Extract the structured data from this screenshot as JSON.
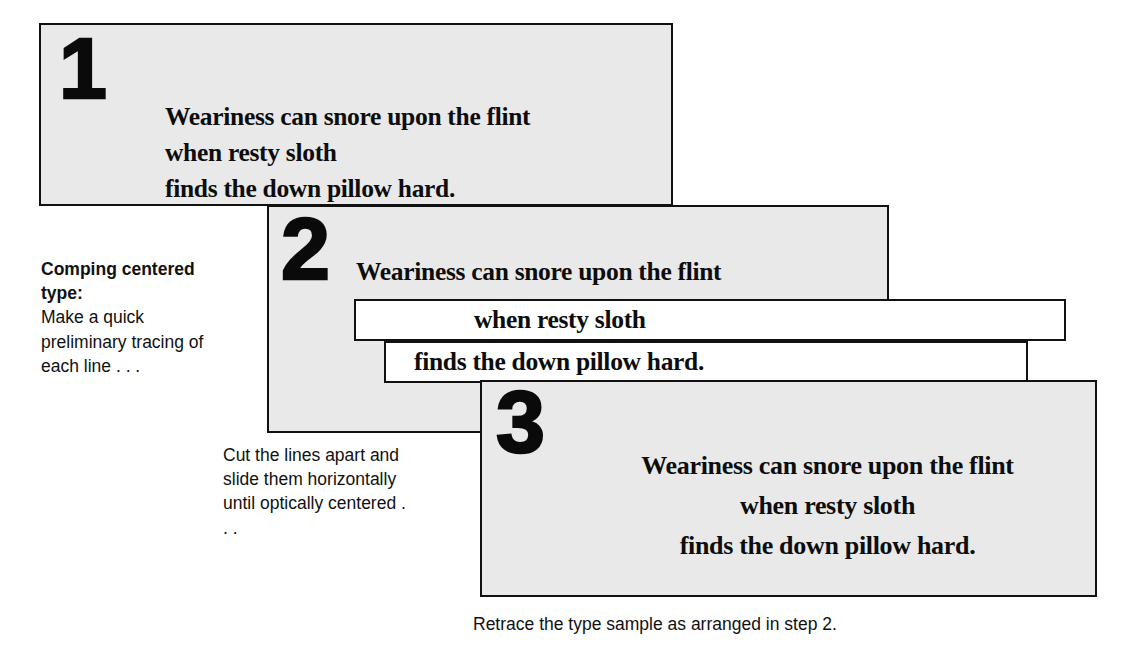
{
  "figure": {
    "title": "Comping centered type",
    "background_color": "#ffffff",
    "panel_fill": "#e9e9e9",
    "panel_border_color": "#111111",
    "strip_fill": "#ffffff",
    "ink_color": "#0d0d0d"
  },
  "sample_text": {
    "line1": "Weariness can snore upon the flint",
    "line2": "when resty sloth",
    "line3": "finds the down pillow hard."
  },
  "steps": [
    {
      "number": "1",
      "alignment": "flush left",
      "lines": [
        "Weariness can snore upon the flint",
        "when resty sloth",
        "finds the down pillow hard."
      ]
    },
    {
      "number": "2",
      "alignment": "cut apart, slid horizontally",
      "lines": [
        "Weariness can snore upon the flint",
        "when resty sloth",
        "finds the down pillow hard."
      ]
    },
    {
      "number": "3",
      "alignment": "optically centered",
      "lines": [
        "Weariness can snore upon the flint",
        "when resty sloth",
        "finds the down pillow hard."
      ]
    }
  ],
  "captions": {
    "step1": {
      "heading": "Comping centered type:",
      "body": "Make a quick preliminary tracing of each line . . ."
    },
    "step2": {
      "body": "Cut the lines apart and slide them horizontally until optically centered . . ."
    },
    "step3": {
      "body": "Retrace the type sample as arranged in step 2."
    }
  }
}
